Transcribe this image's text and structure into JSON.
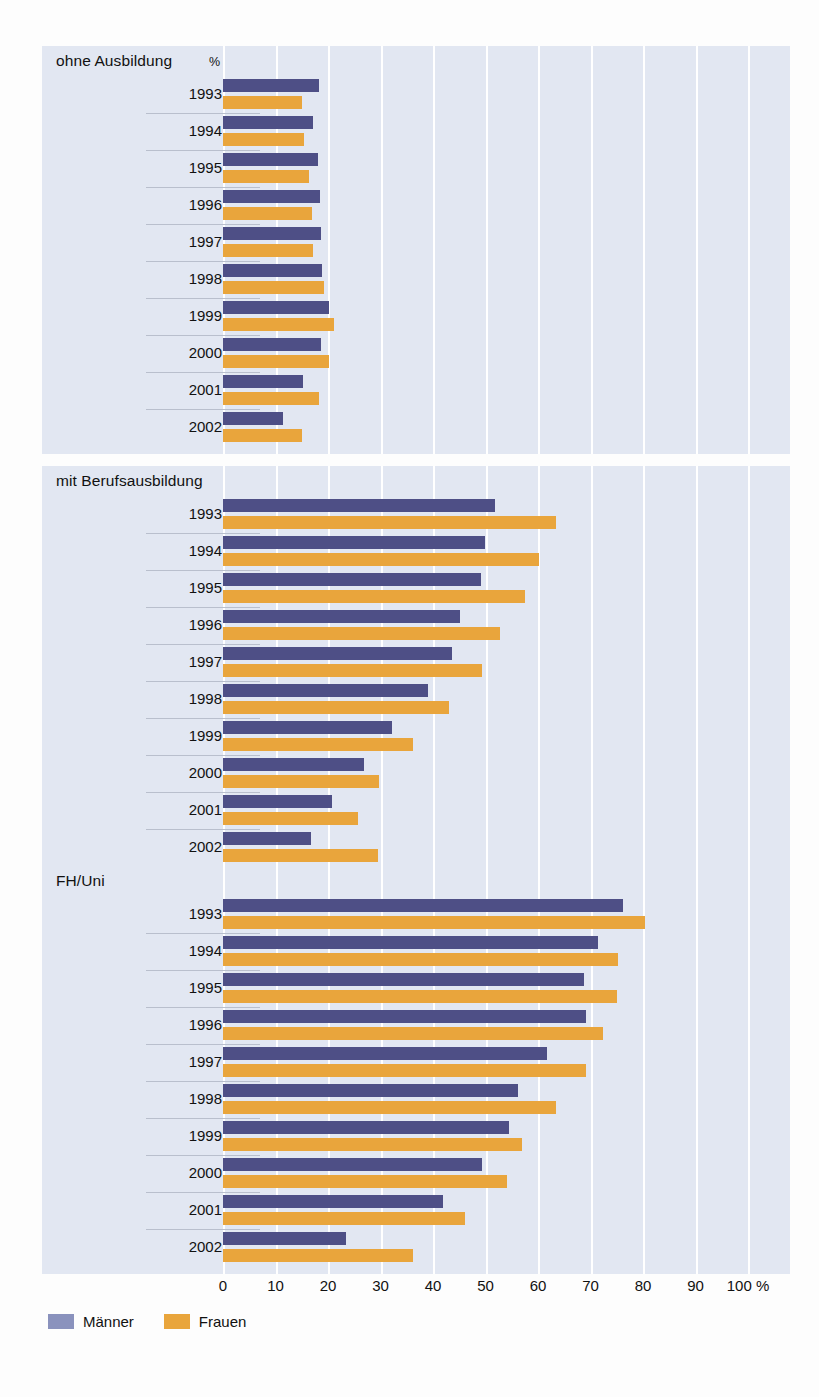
{
  "chart_data": {
    "type": "bar",
    "orientation": "horizontal",
    "title": "",
    "xlabel": "",
    "ylabel": "",
    "xlim": [
      0,
      100
    ],
    "xticks": [
      0,
      10,
      20,
      30,
      40,
      50,
      60,
      70,
      80,
      90,
      100
    ],
    "xtick_labels": [
      "0",
      "10",
      "20",
      "30",
      "40",
      "50",
      "60",
      "70",
      "80",
      "90",
      "100 %"
    ],
    "unit": "%",
    "grid": true,
    "legend_position": "bottom-left",
    "series_names": [
      "Männer",
      "Frauen"
    ],
    "colors": {
      "maenner": "#4e4f86",
      "frauen": "#e9a53c",
      "legend_maenner": "#8a92bd",
      "panel_background": "#e2e7f2",
      "gridline": "#ffffff",
      "page_background": "#fdfdfd"
    },
    "categories": [
      "1993",
      "1994",
      "1995",
      "1996",
      "1997",
      "1998",
      "1999",
      "2000",
      "2001",
      "2002"
    ],
    "panels": [
      {
        "title": "ohne Ausbildung",
        "unit_label": "%",
        "rows": [
          {
            "year": "1993",
            "maenner": 18.3,
            "frauen": 15.0,
            "maenner_label": "18,3",
            "frauen_label": "15,0"
          },
          {
            "year": "1994",
            "maenner": 17.2,
            "frauen": 15.4,
            "maenner_label": "17,2",
            "frauen_label": "15,4"
          },
          {
            "year": "1995",
            "maenner": 18.0,
            "frauen": 16.3,
            "maenner_label": "18,0",
            "frauen_label": "16,3"
          },
          {
            "year": "1996",
            "maenner": 18.5,
            "frauen": 17.0,
            "maenner_label": "18,5",
            "frauen_label": "17,0"
          },
          {
            "year": "1997",
            "maenner": 18.6,
            "frauen": 17.2,
            "maenner_label": "18,6",
            "frauen_label": "17,2"
          },
          {
            "year": "1998",
            "maenner": 18.8,
            "frauen": 19.2,
            "maenner_label": "18,8",
            "frauen_label": "19,2"
          },
          {
            "year": "1999",
            "maenner": 20.2,
            "frauen": 21.2,
            "maenner_label": "20,2",
            "frauen_label": "21,2"
          },
          {
            "year": "2000",
            "maenner": 18.7,
            "frauen": 20.2,
            "maenner_label": "18,7",
            "frauen_label": "20,2"
          },
          {
            "year": "2001",
            "maenner": 15.2,
            "frauen": 18.3,
            "maenner_label": "15,2",
            "frauen_label": "18,3"
          },
          {
            "year": "2002",
            "maenner": 11.5,
            "frauen": 15.1,
            "maenner_label": "11,5",
            "frauen_label": "15,1"
          }
        ]
      },
      {
        "title": "mit Berufsausbildung",
        "unit_label": "",
        "rows": [
          {
            "year": "1993",
            "maenner": 51.9,
            "frauen": 63.4,
            "maenner_label": "51,9",
            "frauen_label": "63,4"
          },
          {
            "year": "1994",
            "maenner": 49.9,
            "frauen": 60.2,
            "maenner_label": "49,9",
            "frauen_label": "60,2"
          },
          {
            "year": "1995",
            "maenner": 49.2,
            "frauen": 57.5,
            "maenner_label": "49,2",
            "frauen_label": "57,5"
          },
          {
            "year": "1996",
            "maenner": 45.1,
            "frauen": 52.7,
            "maenner_label": "45,1",
            "frauen_label": "52,7"
          },
          {
            "year": "1997",
            "maenner": 43.7,
            "frauen": 49.4,
            "maenner_label": "43,7",
            "frauen_label": "49,4"
          },
          {
            "year": "1998",
            "maenner": 39.1,
            "frauen": 43.0,
            "maenner_label": "39,1",
            "frauen_label": "43,0"
          },
          {
            "year": "1999",
            "maenner": 32.2,
            "frauen": 36.1,
            "maenner_label": "32,2",
            "frauen_label": "36,1"
          },
          {
            "year": "2000",
            "maenner": 26.9,
            "frauen": 29.8,
            "maenner_label": "26,9",
            "frauen_label": "29,8"
          },
          {
            "year": "2001",
            "maenner": 20.8,
            "frauen": 25.7,
            "maenner_label": "20,8",
            "frauen_label": "25,7"
          },
          {
            "year": "2002",
            "maenner": 16.8,
            "frauen": 29.6,
            "maenner_label": "16,8",
            "frauen_label": "29,6"
          }
        ]
      },
      {
        "title": "FH/Uni",
        "unit_label": "",
        "rows": [
          {
            "year": "1993",
            "maenner": 76.2,
            "frauen": 80.3,
            "maenner_label": "76,2",
            "frauen_label": "80,3"
          },
          {
            "year": "1994",
            "maenner": 71.4,
            "frauen": 75.3,
            "maenner_label": "71,4",
            "frauen_label": "75,3"
          },
          {
            "year": "1995",
            "maenner": 68.8,
            "frauen": 75.1,
            "maenner_label": "68,8",
            "frauen_label": "75,1"
          },
          {
            "year": "1996",
            "maenner": 69.2,
            "frauen": 72.4,
            "maenner_label": "69,2",
            "frauen_label": "72,4"
          },
          {
            "year": "1997",
            "maenner": 61.8,
            "frauen": 69.2,
            "maenner_label": "61,8",
            "frauen_label": "69,2"
          },
          {
            "year": "1998",
            "maenner": 56.2,
            "frauen": 63.5,
            "maenner_label": "56,2",
            "frauen_label": "63,5"
          },
          {
            "year": "1999",
            "maenner": 54.4,
            "frauen": 57.0,
            "maenner_label": "54,4",
            "frauen_label": "57,0"
          },
          {
            "year": "2000",
            "maenner": 49.4,
            "frauen": 54.0,
            "maenner_label": "49,4",
            "frauen_label": "54,0"
          },
          {
            "year": "2001",
            "maenner": 41.9,
            "frauen": 46.0,
            "maenner_label": "41,9",
            "frauen_label": "46,0"
          },
          {
            "year": "2002",
            "maenner": 23.5,
            "frauen": 36.2,
            "maenner_label": "23,5",
            "frauen_label": "36,2"
          }
        ]
      }
    ],
    "legend": [
      {
        "name": "Männer",
        "color": "#8a92bd"
      },
      {
        "name": "Frauen",
        "color": "#e9a53c"
      }
    ]
  }
}
